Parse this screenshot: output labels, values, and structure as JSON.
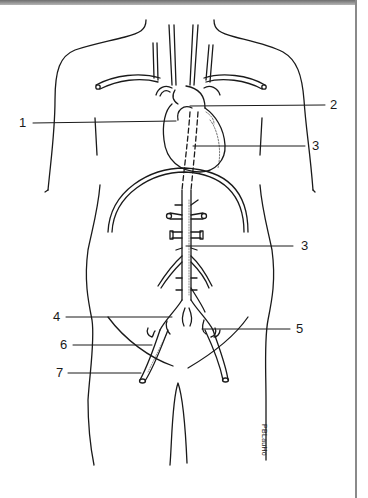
{
  "diagram": {
    "labels": [
      {
        "id": "1",
        "text": "1",
        "side": "left"
      },
      {
        "id": "2",
        "text": "2",
        "side": "right"
      },
      {
        "id": "3a",
        "text": "3",
        "side": "right"
      },
      {
        "id": "3b",
        "text": "3",
        "side": "right"
      },
      {
        "id": "4",
        "text": "4",
        "side": "left"
      },
      {
        "id": "5",
        "text": "5",
        "side": "right"
      },
      {
        "id": "6",
        "text": "6",
        "side": "left"
      },
      {
        "id": "7",
        "text": "7",
        "side": "left"
      }
    ],
    "signature": "PBLauHo"
  },
  "colors": {
    "line": "#1a1a1a",
    "frame": "#8a8a8a",
    "background": "#ffffff"
  }
}
